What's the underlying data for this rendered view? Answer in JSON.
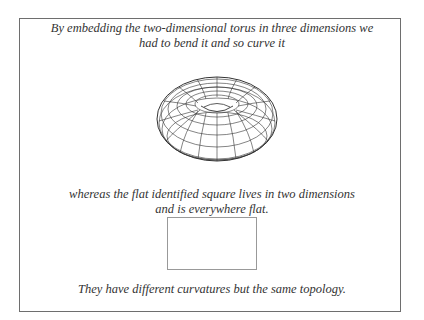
{
  "figure": {
    "caption_top": [
      "By embedding the two-dimensional torus in three dimensions we",
      "had to bend it and so curve it"
    ],
    "caption_middle": [
      "whereas the flat identified square lives in two dimensions",
      "and is everywhere flat."
    ],
    "caption_bottom": "They have different curvatures but the same topology.",
    "shapes": {
      "torus": "wireframe-torus",
      "square": "flat-square"
    },
    "colors": {
      "frame": "#6e6e6e",
      "text": "#333333",
      "square_border": "#999999"
    }
  }
}
